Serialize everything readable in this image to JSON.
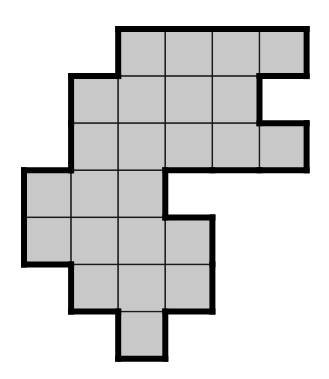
{
  "diagram": {
    "type": "polyomino-grid",
    "cell_count": 25,
    "grid": {
      "origin_x": 24,
      "origin_y": 29,
      "cell_size": 47.1,
      "columns": 6,
      "rows": 7
    },
    "cells": [
      [
        0,
        2
      ],
      [
        0,
        3
      ],
      [
        0,
        4
      ],
      [
        0,
        5
      ],
      [
        1,
        1
      ],
      [
        1,
        2
      ],
      [
        1,
        3
      ],
      [
        1,
        4
      ],
      [
        2,
        1
      ],
      [
        2,
        2
      ],
      [
        2,
        3
      ],
      [
        2,
        4
      ],
      [
        2,
        5
      ],
      [
        3,
        0
      ],
      [
        3,
        1
      ],
      [
        3,
        2
      ],
      [
        4,
        0
      ],
      [
        4,
        1
      ],
      [
        4,
        2
      ],
      [
        4,
        3
      ],
      [
        5,
        1
      ],
      [
        5,
        2
      ],
      [
        5,
        3
      ],
      [
        6,
        2
      ]
    ],
    "colors": {
      "fill": "#c8c8c8",
      "inner_line": "#1a1a1a",
      "outline": "#000000",
      "background": "#ffffff"
    }
  }
}
